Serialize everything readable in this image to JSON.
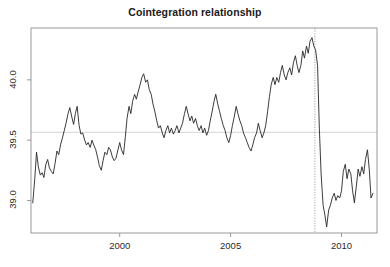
{
  "chart": {
    "title": "Cointegration relationship",
    "type": "line",
    "background": "#ffffff",
    "line_color": "#262626",
    "axis_color": "#808080",
    "hline_color": "#c8c8c8",
    "vline_color": "#9a9a9a"
  },
  "axes": {
    "x": {
      "label": "",
      "ticks": [
        2000,
        2005,
        2010
      ],
      "tick_labels": [
        "2000",
        "2005",
        "2010"
      ],
      "range": [
        1996.0,
        2011.6
      ]
    },
    "y": {
      "label": "",
      "ticks": [
        39.0,
        39.5,
        40.0
      ],
      "tick_labels": [
        "39.0",
        "39.5",
        "40.0"
      ],
      "range": [
        38.73,
        40.43
      ]
    }
  },
  "annotations": {
    "hline": {
      "value": 39.565,
      "style": "solid",
      "name": "mean-reference-line"
    },
    "vline": {
      "value": 2008.8,
      "style": "dotted",
      "name": "structural-break-line"
    }
  },
  "chart_data": {
    "type": "line",
    "title": "Cointegration relationship",
    "xlabel": "",
    "ylabel": "",
    "xlim": [
      1996.0,
      2011.6
    ],
    "ylim": [
      38.73,
      40.43
    ],
    "xticks": [
      2000,
      2005,
      2010
    ],
    "yticks": [
      39.0,
      39.5,
      40.0
    ],
    "grid": false,
    "legend": "none",
    "hline": 39.565,
    "vline": 2008.8,
    "series": [
      {
        "name": "cointegration residual",
        "x": [
          1996.08,
          1996.17,
          1996.25,
          1996.33,
          1996.42,
          1996.5,
          1996.58,
          1996.67,
          1996.75,
          1996.83,
          1996.92,
          1997.0,
          1997.08,
          1997.17,
          1997.25,
          1997.33,
          1997.42,
          1997.5,
          1997.58,
          1997.67,
          1997.75,
          1997.83,
          1997.92,
          1998.0,
          1998.08,
          1998.17,
          1998.25,
          1998.33,
          1998.42,
          1998.5,
          1998.58,
          1998.67,
          1998.75,
          1998.83,
          1998.92,
          1999.0,
          1999.08,
          1999.17,
          1999.25,
          1999.33,
          1999.42,
          1999.5,
          1999.58,
          1999.67,
          1999.75,
          1999.83,
          1999.92,
          2000.0,
          2000.08,
          2000.17,
          2000.25,
          2000.33,
          2000.42,
          2000.5,
          2000.58,
          2000.67,
          2000.75,
          2000.83,
          2000.92,
          2001.0,
          2001.08,
          2001.17,
          2001.25,
          2001.33,
          2001.42,
          2001.5,
          2001.58,
          2001.67,
          2001.75,
          2001.83,
          2001.92,
          2002.0,
          2002.08,
          2002.17,
          2002.25,
          2002.33,
          2002.42,
          2002.5,
          2002.58,
          2002.67,
          2002.75,
          2002.83,
          2002.92,
          2003.0,
          2003.08,
          2003.17,
          2003.25,
          2003.33,
          2003.42,
          2003.5,
          2003.58,
          2003.67,
          2003.75,
          2003.83,
          2003.92,
          2004.0,
          2004.08,
          2004.17,
          2004.25,
          2004.33,
          2004.42,
          2004.5,
          2004.58,
          2004.67,
          2004.75,
          2004.83,
          2004.92,
          2005.0,
          2005.08,
          2005.17,
          2005.25,
          2005.33,
          2005.42,
          2005.5,
          2005.58,
          2005.67,
          2005.75,
          2005.83,
          2005.92,
          2006.0,
          2006.08,
          2006.17,
          2006.25,
          2006.33,
          2006.42,
          2006.5,
          2006.58,
          2006.67,
          2006.75,
          2006.83,
          2006.92,
          2007.0,
          2007.08,
          2007.17,
          2007.25,
          2007.33,
          2007.42,
          2007.5,
          2007.58,
          2007.67,
          2007.75,
          2007.83,
          2007.92,
          2008.0,
          2008.08,
          2008.17,
          2008.25,
          2008.33,
          2008.42,
          2008.5,
          2008.58,
          2008.67,
          2008.75,
          2008.83,
          2008.92,
          2009.0,
          2009.08,
          2009.17,
          2009.25,
          2009.33,
          2009.42,
          2009.5,
          2009.58,
          2009.67,
          2009.75,
          2009.83,
          2009.92,
          2010.0,
          2010.08,
          2010.17,
          2010.25,
          2010.33,
          2010.42,
          2010.5,
          2010.58,
          2010.67,
          2010.75,
          2010.83,
          2010.92,
          2011.0,
          2011.08,
          2011.17,
          2011.25,
          2011.33,
          2011.42
        ],
        "values": [
          38.98,
          39.18,
          39.4,
          39.28,
          39.21,
          39.23,
          39.19,
          39.3,
          39.34,
          39.27,
          39.24,
          39.22,
          39.3,
          39.41,
          39.38,
          39.46,
          39.52,
          39.58,
          39.64,
          39.72,
          39.77,
          39.7,
          39.63,
          39.72,
          39.78,
          39.62,
          39.55,
          39.56,
          39.5,
          39.46,
          39.48,
          39.44,
          39.5,
          39.46,
          39.42,
          39.36,
          39.29,
          39.25,
          39.33,
          39.4,
          39.38,
          39.44,
          39.42,
          39.36,
          39.33,
          39.35,
          39.42,
          39.48,
          39.42,
          39.38,
          39.52,
          39.68,
          39.78,
          39.72,
          39.82,
          39.88,
          39.84,
          39.9,
          39.96,
          40.02,
          40.05,
          39.98,
          40.0,
          39.92,
          39.88,
          39.8,
          39.74,
          39.66,
          39.6,
          39.62,
          39.56,
          39.52,
          39.58,
          39.62,
          39.56,
          39.6,
          39.55,
          39.58,
          39.62,
          39.56,
          39.6,
          39.64,
          39.72,
          39.78,
          39.72,
          39.66,
          39.7,
          39.64,
          39.68,
          39.62,
          39.58,
          39.62,
          39.56,
          39.6,
          39.54,
          39.58,
          39.66,
          39.74,
          39.82,
          39.88,
          39.8,
          39.74,
          39.68,
          39.62,
          39.58,
          39.52,
          39.48,
          39.54,
          39.62,
          39.7,
          39.78,
          39.72,
          39.66,
          39.62,
          39.56,
          39.52,
          39.48,
          39.44,
          39.41,
          39.46,
          39.52,
          39.56,
          39.64,
          39.58,
          39.52,
          39.56,
          39.62,
          39.74,
          39.86,
          39.96,
          40.02,
          39.96,
          40.02,
          39.98,
          40.06,
          40.12,
          40.04,
          40.0,
          40.06,
          40.1,
          40.04,
          40.14,
          40.2,
          40.12,
          40.06,
          40.12,
          40.24,
          40.18,
          40.28,
          40.22,
          40.32,
          40.35,
          40.28,
          40.25,
          40.12,
          39.6,
          39.22,
          38.96,
          38.88,
          38.78,
          38.92,
          38.96,
          39.02,
          39.06,
          39.0,
          39.04,
          39.02,
          39.08,
          39.24,
          39.3,
          39.18,
          39.26,
          39.22,
          39.08,
          38.98,
          39.12,
          39.26,
          39.2,
          39.28,
          39.22,
          39.34,
          39.42,
          39.26,
          39.02,
          39.06
        ]
      }
    ]
  }
}
